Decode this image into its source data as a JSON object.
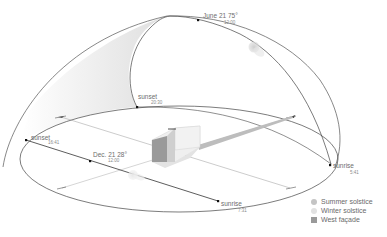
{
  "points": {
    "june_noon": {
      "label": "June 21 75°",
      "time": "12:00"
    },
    "june_sunset": {
      "label": "sunset",
      "time": "20:30"
    },
    "june_sunrise": {
      "label": "sunrise",
      "time": "5:41"
    },
    "dec_noon": {
      "label": "Dec. 21 28°",
      "time": "12:00"
    },
    "dec_sunset": {
      "label": "sunset",
      "time": "16:41"
    },
    "dec_sunrise": {
      "label": "sunrise",
      "time": "7:31"
    }
  },
  "legend": [
    {
      "label": "Summer solstice",
      "color": "#c4c4c4",
      "shape": "circle"
    },
    {
      "label": "Winter solstice",
      "color": "#e2e2e2",
      "shape": "circle"
    },
    {
      "label": "West façade",
      "color": "#9a9a9a",
      "shape": "square"
    }
  ],
  "colors": {
    "line": "#555555",
    "thin_line": "#9a9a9a",
    "dot": "#111111"
  }
}
